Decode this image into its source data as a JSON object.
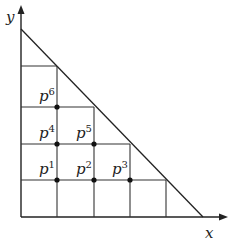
{
  "diagram": {
    "axes": {
      "x_label": "x",
      "y_label": "y"
    },
    "origin": {
      "x": 21,
      "y": 217
    },
    "cell": 36.5,
    "triangle": {
      "from": [
        21,
        29
      ],
      "to": [
        203,
        217
      ]
    },
    "grid_rows": [
      {
        "y": 180,
        "x1": 21,
        "x2": 166
      },
      {
        "y": 144,
        "x1": 21,
        "x2": 130
      },
      {
        "y": 107,
        "x1": 21,
        "x2": 94
      },
      {
        "y": 66,
        "x1": 21,
        "x2": 57
      }
    ],
    "grid_cols": [
      {
        "x": 57,
        "y1": 66,
        "y2": 217
      },
      {
        "x": 94,
        "y1": 107,
        "y2": 217
      },
      {
        "x": 130,
        "y1": 144,
        "y2": 217
      },
      {
        "x": 166,
        "y1": 180,
        "y2": 217
      }
    ],
    "points": [
      {
        "base": "p",
        "sup": "1",
        "x": 57,
        "y": 180
      },
      {
        "base": "p",
        "sup": "2",
        "x": 94,
        "y": 180
      },
      {
        "base": "p",
        "sup": "3",
        "x": 130,
        "y": 180
      },
      {
        "base": "p",
        "sup": "4",
        "x": 57,
        "y": 144
      },
      {
        "base": "p",
        "sup": "5",
        "x": 94,
        "y": 144
      },
      {
        "base": "p",
        "sup": "6",
        "x": 57,
        "y": 107
      }
    ],
    "colors": {
      "line": "#222222",
      "point": "#111111",
      "background": "#ffffff"
    }
  }
}
